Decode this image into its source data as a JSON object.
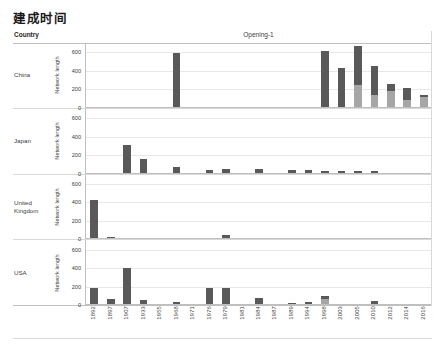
{
  "title": "建成时间",
  "header": {
    "country_label": "Country",
    "opening_label": "Opening-1"
  },
  "axis": {
    "y_title": "Network length",
    "y_ticks": [
      "600",
      "400",
      "200",
      "0"
    ]
  },
  "colors": {
    "bar_dark": "#595959",
    "bar_light": "#a6a6a6",
    "grid": "#e8e8e8",
    "axis": "#bfbfbf",
    "text": "#404040"
  },
  "chart_data": {
    "type": "bar",
    "title": "建成时间",
    "xlabel": "Opening-1",
    "ylabel": "Network length",
    "ylim": [
      0,
      700
    ],
    "grid": true,
    "legend": "none",
    "stacked": true,
    "categories": [
      "1892",
      "1897",
      "1907",
      "1933",
      "1955",
      "1968",
      "1971",
      "1976",
      "1979",
      "1981",
      "1984",
      "1987",
      "1989",
      "1994",
      "1998",
      "2003",
      "2005",
      "2010",
      "2012",
      "2014",
      "2016"
    ],
    "panels": [
      {
        "name": "China",
        "values": [
          0,
          0,
          0,
          0,
          0,
          580,
          0,
          0,
          0,
          0,
          0,
          0,
          0,
          0,
          600,
          420,
          660,
          440,
          250,
          200,
          130
        ],
        "light_base": [
          0,
          0,
          0,
          0,
          0,
          0,
          0,
          0,
          0,
          0,
          0,
          0,
          0,
          0,
          0,
          0,
          230,
          130,
          170,
          70,
          110
        ]
      },
      {
        "name": "Japan",
        "values": [
          0,
          0,
          300,
          150,
          0,
          60,
          0,
          30,
          35,
          0,
          40,
          0,
          25,
          25,
          20,
          20,
          12,
          12,
          0,
          0,
          0
        ],
        "light_base": [
          0,
          0,
          0,
          0,
          0,
          0,
          0,
          0,
          0,
          0,
          0,
          0,
          0,
          0,
          0,
          0,
          0,
          0,
          0,
          0,
          0
        ]
      },
      {
        "name": "United Kingdom",
        "values": [
          410,
          12,
          0,
          0,
          0,
          0,
          0,
          0,
          40,
          0,
          0,
          0,
          0,
          0,
          0,
          0,
          0,
          0,
          0,
          0,
          0
        ],
        "light_base": [
          0,
          0,
          0,
          0,
          0,
          0,
          0,
          0,
          0,
          0,
          0,
          0,
          0,
          0,
          0,
          0,
          0,
          0,
          0,
          0,
          0
        ]
      },
      {
        "name": "USA",
        "values": [
          170,
          50,
          390,
          40,
          0,
          20,
          0,
          170,
          175,
          0,
          60,
          0,
          15,
          20,
          90,
          0,
          0,
          30,
          0,
          0,
          0
        ],
        "light_base": [
          0,
          0,
          0,
          0,
          0,
          0,
          0,
          0,
          0,
          0,
          0,
          0,
          0,
          0,
          55,
          0,
          0,
          0,
          0,
          0,
          0
        ]
      }
    ]
  }
}
